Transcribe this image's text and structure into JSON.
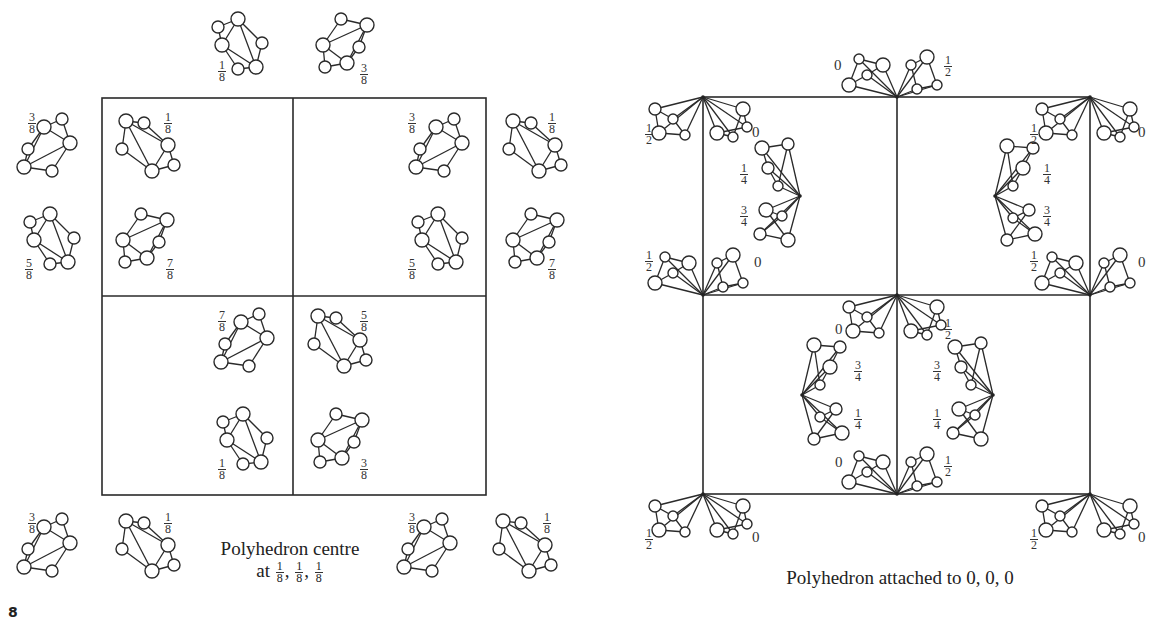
{
  "figure": {
    "figure_number_fragment": "8",
    "left_panel": {
      "caption_line1": "Polyhedron centre",
      "caption_line2_prefix": "at",
      "caption_coords": [
        {
          "num": "1",
          "den": "8"
        },
        {
          "num": "1",
          "den": "8"
        },
        {
          "num": "1",
          "den": "8"
        }
      ],
      "cell_box": {
        "x1": 102,
        "y1": 98,
        "x2": 486,
        "y2": 495,
        "mid_x": 293,
        "mid_y": 296
      },
      "polyhedra": [
        {
          "x": 240,
          "y": 45,
          "type": "A",
          "label": {
            "num": "1",
            "den": "8"
          },
          "lx": 218,
          "ly": 60
        },
        {
          "x": 345,
          "y": 45,
          "type": "B",
          "label": {
            "num": "3",
            "den": "8"
          },
          "lx": 360,
          "ly": 63
        },
        {
          "x": 48,
          "y": 145,
          "type": "C",
          "label": {
            "num": "3",
            "den": "8"
          },
          "lx": 28,
          "ly": 112
        },
        {
          "x": 148,
          "y": 145,
          "type": "D",
          "label": {
            "num": "1",
            "den": "8"
          },
          "lx": 164,
          "ly": 112
        },
        {
          "x": 440,
          "y": 145,
          "type": "C",
          "label": {
            "num": "3",
            "den": "8"
          },
          "lx": 408,
          "ly": 112
        },
        {
          "x": 535,
          "y": 145,
          "type": "D",
          "label": {
            "num": "1",
            "den": "8"
          },
          "lx": 548,
          "ly": 112
        },
        {
          "x": 52,
          "y": 240,
          "type": "A",
          "label": {
            "num": "5",
            "den": "8"
          },
          "lx": 25,
          "ly": 258
        },
        {
          "x": 145,
          "y": 240,
          "type": "B",
          "label": {
            "num": "7",
            "den": "8"
          },
          "lx": 166,
          "ly": 258
        },
        {
          "x": 440,
          "y": 240,
          "type": "A",
          "label": {
            "num": "5",
            "den": "8"
          },
          "lx": 408,
          "ly": 258
        },
        {
          "x": 535,
          "y": 240,
          "type": "B",
          "label": {
            "num": "7",
            "den": "8"
          },
          "lx": 548,
          "ly": 258
        },
        {
          "x": 245,
          "y": 340,
          "type": "C",
          "label": {
            "num": "7",
            "den": "8"
          },
          "lx": 218,
          "ly": 310
        },
        {
          "x": 340,
          "y": 340,
          "type": "D",
          "label": {
            "num": "5",
            "den": "8"
          },
          "lx": 360,
          "ly": 310
        },
        {
          "x": 245,
          "y": 440,
          "type": "A",
          "label": {
            "num": "1",
            "den": "8"
          },
          "lx": 218,
          "ly": 458
        },
        {
          "x": 340,
          "y": 440,
          "type": "B",
          "label": {
            "num": "3",
            "den": "8"
          },
          "lx": 360,
          "ly": 458
        },
        {
          "x": 48,
          "y": 545,
          "type": "C",
          "label": {
            "num": "3",
            "den": "8"
          },
          "lx": 28,
          "ly": 512
        },
        {
          "x": 148,
          "y": 545,
          "type": "D",
          "label": {
            "num": "1",
            "den": "8"
          },
          "lx": 164,
          "ly": 512
        },
        {
          "x": 428,
          "y": 545,
          "type": "C",
          "label": {
            "num": "3",
            "den": "8"
          },
          "lx": 408,
          "ly": 512
        },
        {
          "x": 525,
          "y": 545,
          "type": "D",
          "label": {
            "num": "1",
            "den": "8"
          },
          "lx": 543,
          "ly": 512
        }
      ]
    },
    "right_panel": {
      "caption": "Polyhedron attached to 0, 0, 0",
      "cell_box": {
        "x1": 703,
        "y1": 97,
        "x2": 1090,
        "y2": 494,
        "mid_x": 897,
        "mid_y": 295
      },
      "vertex_clusters": [
        {
          "x": 703,
          "y": 97,
          "dir": "down",
          "labels": [
            {
              "text": "1/2",
              "lx": 645,
              "ly": 123
            },
            {
              "text": "0",
              "lx": 752,
              "ly": 125
            }
          ]
        },
        {
          "x": 1090,
          "y": 97,
          "dir": "down",
          "labels": [
            {
              "text": "1/2",
              "lx": 1030,
              "ly": 123
            },
            {
              "text": "0",
              "lx": 1138,
              "ly": 125
            }
          ]
        },
        {
          "x": 897,
          "y": 97,
          "dir": "up",
          "labels": [
            {
              "text": "0",
              "lx": 834,
              "ly": 58
            },
            {
              "text": "1/2",
              "lx": 944,
              "ly": 55
            }
          ]
        },
        {
          "x": 703,
          "y": 295,
          "dir": "up",
          "labels": [
            {
              "text": "1/2",
              "lx": 645,
              "ly": 250
            },
            {
              "text": "0",
              "lx": 754,
              "ly": 255
            }
          ]
        },
        {
          "x": 1090,
          "y": 295,
          "dir": "up",
          "labels": [
            {
              "text": "1/2",
              "lx": 1030,
              "ly": 250
            },
            {
              "text": "0",
              "lx": 1138,
              "ly": 255
            }
          ]
        },
        {
          "x": 897,
          "y": 295,
          "dir": "down",
          "labels": [
            {
              "text": "0",
              "lx": 835,
              "ly": 322
            },
            {
              "text": "1/2",
              "lx": 944,
              "ly": 318
            }
          ]
        },
        {
          "x": 897,
          "y": 494,
          "dir": "up",
          "labels": [
            {
              "text": "0",
              "lx": 835,
              "ly": 455
            },
            {
              "text": "1/2",
              "lx": 944,
              "ly": 455
            }
          ]
        },
        {
          "x": 703,
          "y": 494,
          "dir": "down",
          "labels": [
            {
              "text": "1/2",
              "lx": 645,
              "ly": 528
            },
            {
              "text": "0",
              "lx": 752,
              "ly": 530
            }
          ]
        },
        {
          "x": 1090,
          "y": 494,
          "dir": "down",
          "labels": [
            {
              "text": "1/2",
              "lx": 1030,
              "ly": 528
            },
            {
              "text": "0",
              "lx": 1138,
              "ly": 530
            }
          ]
        }
      ],
      "side_clusters": [
        {
          "x": 800,
          "y": 196,
          "dir": "left",
          "labels": [
            {
              "text": "1/4",
              "lx": 740,
              "ly": 163
            },
            {
              "text": "3/4",
              "lx": 740,
              "ly": 205
            }
          ]
        },
        {
          "x": 995,
          "y": 196,
          "dir": "right",
          "labels": [
            {
              "text": "1/4",
              "lx": 1043,
              "ly": 163
            },
            {
              "text": "3/4",
              "lx": 1043,
              "ly": 205
            }
          ]
        },
        {
          "x": 802,
          "y": 395,
          "dir": "right",
          "labels": [
            {
              "text": "3/4",
              "lx": 854,
              "ly": 360
            },
            {
              "text": "1/4",
              "lx": 854,
              "ly": 408
            }
          ]
        },
        {
          "x": 993,
          "y": 395,
          "dir": "left",
          "labels": [
            {
              "text": "3/4",
              "lx": 933,
              "ly": 360
            },
            {
              "text": "1/4",
              "lx": 933,
              "ly": 408
            }
          ]
        }
      ]
    }
  }
}
